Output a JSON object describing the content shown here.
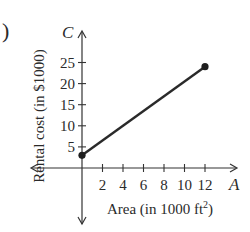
{
  "panel_label": ")",
  "chart_data": {
    "type": "line",
    "title": "",
    "xlabel": "Area (in 1000 ft²)",
    "xlabel_base": "Area (in 1000 ft",
    "xlabel_sup": "2",
    "xlabel_close": ")",
    "ylabel": "Rental cost (in $1000)",
    "x_axis_var": "A",
    "y_axis_var": "C",
    "x_ticks": [
      2,
      4,
      6,
      8,
      10,
      12
    ],
    "y_ticks": [
      5,
      10,
      15,
      20,
      25
    ],
    "x": [
      0,
      12
    ],
    "y": [
      3,
      24
    ],
    "endpoints": "closed",
    "xlim": [
      -2,
      14
    ],
    "ylim": [
      -5,
      29
    ],
    "grid": false,
    "legend": null
  }
}
